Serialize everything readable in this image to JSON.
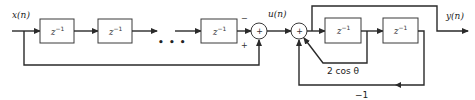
{
  "diagram": {
    "type": "signal-flow block diagram",
    "input_label": "x(n)",
    "intermediate_label": "u(n)",
    "output_label": "y(n)",
    "delay_label": {
      "base": "z",
      "exponent": "−1"
    },
    "ellipsis": "• • •",
    "delay_blocks": [
      {
        "id": "delay-1",
        "stage": "comb"
      },
      {
        "id": "delay-2",
        "stage": "comb"
      },
      {
        "id": "delay-n",
        "stage": "comb"
      },
      {
        "id": "delay-res-1",
        "stage": "resonator"
      },
      {
        "id": "delay-res-2",
        "stage": "resonator"
      }
    ],
    "summers": [
      {
        "id": "summer-1",
        "symbol": "+",
        "inputs": [
          {
            "sign": "−",
            "from": "delay chain"
          },
          {
            "sign": "+",
            "from": "x(n) feedforward"
          }
        ]
      },
      {
        "id": "summer-2",
        "symbol": "+",
        "inputs": [
          "u(n)",
          "2cosθ feedback",
          "−1 feedback"
        ]
      }
    ],
    "gains": {
      "feedback_1": "2 cos θ",
      "feedback_2": "−1"
    },
    "signs": {
      "minus": "−",
      "plus": "+"
    }
  }
}
